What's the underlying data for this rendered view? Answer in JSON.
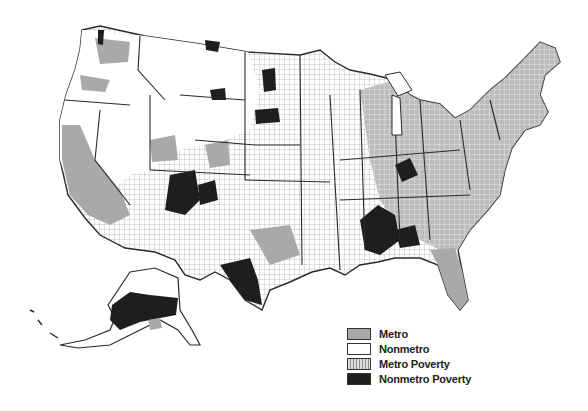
{
  "map": {
    "subject": "United States counties by metro/nonmetro status and poverty",
    "regions": [
      "Contiguous United States",
      "Alaska"
    ]
  },
  "legend": {
    "items": [
      {
        "label": "Metro",
        "fill": "#a9a9a9",
        "pattern": "solid"
      },
      {
        "label": "Nonmetro",
        "fill": "#ffffff",
        "pattern": "solid"
      },
      {
        "label": "Metro Poverty",
        "fill": "#e6e6e6",
        "pattern": "dotted"
      },
      {
        "label": "Nonmetro Poverty",
        "fill": "#1e1e1e",
        "pattern": "solid"
      }
    ]
  },
  "colors": {
    "border": "#2a2a2a",
    "county_line": "#8a8a8a",
    "metro": "#a9a9a9",
    "nonmetro": "#ffffff",
    "nonmetro_poverty": "#1e1e1e"
  }
}
